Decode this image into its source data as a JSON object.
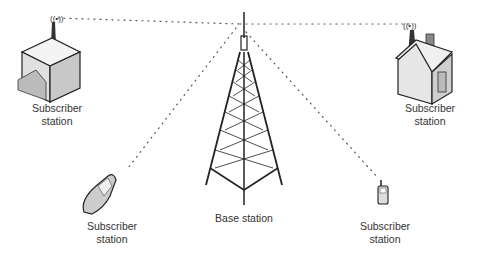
{
  "diagram": {
    "type": "wireless network topology",
    "base_station": {
      "label": "Base station",
      "icon": "tower-icon"
    },
    "subscribers": [
      {
        "label_line1": "Subscriber",
        "label_line2": "station",
        "icon": "office-building-icon",
        "position": "top-left"
      },
      {
        "label_line1": "Subscriber",
        "label_line2": "station",
        "icon": "house-icon",
        "position": "top-right"
      },
      {
        "label_line1": "Subscriber",
        "label_line2": "station",
        "icon": "flip-phone-icon",
        "position": "bottom-left"
      },
      {
        "label_line1": "Subscriber",
        "label_line2": "station",
        "icon": "mobile-phone-icon",
        "position": "bottom-right"
      }
    ],
    "link_style": "dotted"
  }
}
